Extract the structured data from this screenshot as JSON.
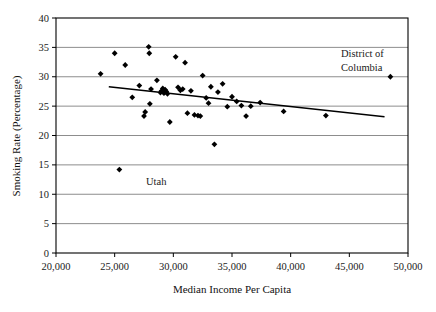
{
  "chart_data": {
    "type": "scatter",
    "title": "",
    "xlabel": "Median Income Per Capita",
    "ylabel": "Smoking Rate (Percentage)",
    "xlim": [
      20000,
      50000
    ],
    "ylim": [
      0,
      40
    ],
    "xticks": [
      20000,
      25000,
      30000,
      35000,
      40000,
      45000,
      50000
    ],
    "xtick_labels": [
      "20,000",
      "25,000",
      "30,000",
      "35,000",
      "40,000",
      "45,000",
      "50,000"
    ],
    "yticks": [
      0,
      5,
      10,
      15,
      20,
      25,
      30,
      35,
      40
    ],
    "ytick_labels": [
      "0",
      "5",
      "10",
      "15",
      "20",
      "25",
      "30",
      "35",
      "40"
    ],
    "grid": "horizontal",
    "legend": "none",
    "marker": "diamond",
    "marker_color": "#000000",
    "points": [
      {
        "x": 23800,
        "y": 30.5
      },
      {
        "x": 25000,
        "y": 34.0
      },
      {
        "x": 25400,
        "y": 14.2
      },
      {
        "x": 25900,
        "y": 32.0
      },
      {
        "x": 26500,
        "y": 26.5
      },
      {
        "x": 27100,
        "y": 28.5
      },
      {
        "x": 27500,
        "y": 23.3
      },
      {
        "x": 27600,
        "y": 24.0
      },
      {
        "x": 27900,
        "y": 35.1
      },
      {
        "x": 27950,
        "y": 34.0
      },
      {
        "x": 28000,
        "y": 25.4
      },
      {
        "x": 28100,
        "y": 27.9
      },
      {
        "x": 28600,
        "y": 29.4
      },
      {
        "x": 28900,
        "y": 27.3
      },
      {
        "x": 29000,
        "y": 27.6
      },
      {
        "x": 29100,
        "y": 28.0
      },
      {
        "x": 29200,
        "y": 27.2
      },
      {
        "x": 29300,
        "y": 27.8
      },
      {
        "x": 29400,
        "y": 27.5
      },
      {
        "x": 29500,
        "y": 27.1
      },
      {
        "x": 29700,
        "y": 22.3
      },
      {
        "x": 30200,
        "y": 33.4
      },
      {
        "x": 30400,
        "y": 28.2
      },
      {
        "x": 30600,
        "y": 27.7
      },
      {
        "x": 30800,
        "y": 27.9
      },
      {
        "x": 31000,
        "y": 32.4
      },
      {
        "x": 31200,
        "y": 23.8
      },
      {
        "x": 31500,
        "y": 27.6
      },
      {
        "x": 31800,
        "y": 23.5
      },
      {
        "x": 32100,
        "y": 23.4
      },
      {
        "x": 32300,
        "y": 23.3
      },
      {
        "x": 32500,
        "y": 30.2
      },
      {
        "x": 32800,
        "y": 26.4
      },
      {
        "x": 33000,
        "y": 25.5
      },
      {
        "x": 33200,
        "y": 28.3
      },
      {
        "x": 33500,
        "y": 18.5
      },
      {
        "x": 33800,
        "y": 27.4
      },
      {
        "x": 34200,
        "y": 28.8
      },
      {
        "x": 34600,
        "y": 24.9
      },
      {
        "x": 35000,
        "y": 26.6
      },
      {
        "x": 35400,
        "y": 25.8
      },
      {
        "x": 35800,
        "y": 25.1
      },
      {
        "x": 36200,
        "y": 23.3
      },
      {
        "x": 36600,
        "y": 25.0
      },
      {
        "x": 37400,
        "y": 25.6
      },
      {
        "x": 39400,
        "y": 24.1
      },
      {
        "x": 43000,
        "y": 23.4
      },
      {
        "x": 48500,
        "y": 30.0
      }
    ],
    "trendline": {
      "x_start": 24500,
      "y_start": 28.3,
      "x_end": 48000,
      "y_end": 23.2,
      "color": "#000000"
    },
    "annotations": [
      {
        "id": "dc",
        "lines": [
          "District of",
          "Columbia"
        ],
        "x": 43000,
        "y": 33.8
      },
      {
        "id": "utah",
        "lines": [
          "Utah"
        ],
        "x": 27100,
        "y": 13.9
      }
    ]
  },
  "axes": {
    "frame_color": "#000000",
    "grid_color": "#808080"
  }
}
